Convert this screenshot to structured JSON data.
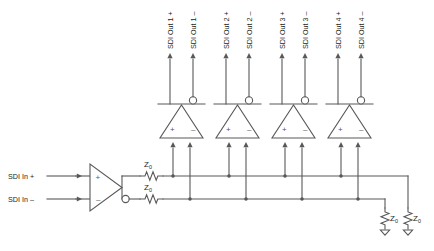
{
  "diagram": {
    "type": "schematic",
    "colors": {
      "wire": "#58585a",
      "text": "#231f20",
      "background": "#ffffff"
    },
    "inputs": [
      {
        "id": "in-plus",
        "label": "SDI In +",
        "pin": "+"
      },
      {
        "id": "in-minus",
        "label": "SDI In –",
        "pin": "–"
      }
    ],
    "input_amplifier": {
      "name": "input-buffer",
      "pin_plus": "+",
      "pin_minus": "–",
      "has_inverting_bubble": true
    },
    "series_resistors": [
      {
        "id": "series-z0-top",
        "label": "Z",
        "subscript": "0"
      },
      {
        "id": "series-z0-bottom",
        "label": "Z",
        "subscript": "0"
      }
    ],
    "drivers": [
      {
        "id": "driver-1",
        "pin_plus": "+",
        "pin_minus": "–",
        "outputs": [
          {
            "id": "out-1-plus",
            "label": "SDI Out 1 +"
          },
          {
            "id": "out-1-minus",
            "label": "SDI Out 1 –"
          }
        ]
      },
      {
        "id": "driver-2",
        "pin_plus": "+",
        "pin_minus": "–",
        "outputs": [
          {
            "id": "out-2-plus",
            "label": "SDI Out 2 +"
          },
          {
            "id": "out-2-minus",
            "label": "SDI Out 2 –"
          }
        ]
      },
      {
        "id": "driver-3",
        "pin_plus": "+",
        "pin_minus": "–",
        "outputs": [
          {
            "id": "out-3-plus",
            "label": "SDI Out 3 +"
          },
          {
            "id": "out-3-minus",
            "label": "SDI Out 3 –"
          }
        ]
      },
      {
        "id": "driver-4",
        "pin_plus": "+",
        "pin_minus": "–",
        "outputs": [
          {
            "id": "out-4-plus",
            "label": "SDI Out 4 +"
          },
          {
            "id": "out-4-minus",
            "label": "SDI Out 4 –"
          }
        ]
      }
    ],
    "termination_resistors": [
      {
        "id": "term-z0-left",
        "label": "Z",
        "subscript": "0"
      },
      {
        "id": "term-z0-right",
        "label": "Z",
        "subscript": "0"
      }
    ]
  }
}
